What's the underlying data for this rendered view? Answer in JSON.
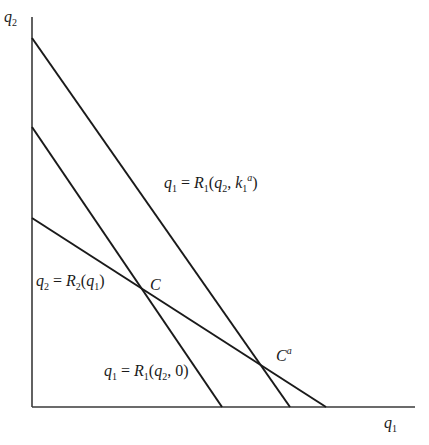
{
  "diagram": {
    "axes": {
      "y_label_var": "q",
      "y_label_sub": "2",
      "x_label_var": "q",
      "x_label_sub": "1"
    },
    "curves": [
      {
        "id": "r1-ka",
        "label_lhs_var": "q",
        "label_lhs_sub": "1",
        "label_eq": "=",
        "label_fn": "R",
        "label_fn_sub": "1",
        "label_open": "(",
        "label_arg1_var": "q",
        "label_arg1_sub": "2",
        "label_comma": ",",
        "label_arg2_var": "k",
        "label_arg2_sub": "1",
        "label_arg2_sup": "a",
        "label_close": ")"
      },
      {
        "id": "r1-0",
        "label_lhs_var": "q",
        "label_lhs_sub": "1",
        "label_eq": "=",
        "label_fn": "R",
        "label_fn_sub": "1",
        "label_open": "(",
        "label_arg1_var": "q",
        "label_arg1_sub": "2",
        "label_rest": ", 0)"
      },
      {
        "id": "r2",
        "label_lhs_var": "q",
        "label_lhs_sub": "2",
        "label_eq": "=",
        "label_fn": "R",
        "label_fn_sub": "2",
        "label_open": "(",
        "label_arg1_var": "q",
        "label_arg1_sub": "1",
        "label_close": ")"
      }
    ],
    "points": [
      {
        "id": "C",
        "label": "C"
      },
      {
        "id": "Ca",
        "label": "C",
        "label_sup": "a"
      }
    ],
    "colors": {
      "line": "#1a1a1a",
      "axis": "#3a3a3a"
    }
  }
}
